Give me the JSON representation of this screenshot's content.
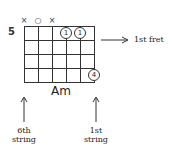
{
  "chord": {
    "name": "Am",
    "start_fret_label": "5",
    "strings": 6,
    "frets": 4,
    "string_markers": [
      {
        "string": 6,
        "symbol": "×",
        "meaning": "muted"
      },
      {
        "string": 5,
        "symbol": "○",
        "meaning": "open"
      },
      {
        "string": 4,
        "symbol": "×",
        "meaning": "muted"
      }
    ],
    "fingers": [
      {
        "string": 3,
        "fret": 1,
        "finger": "1"
      },
      {
        "string": 2,
        "fret": 1,
        "finger": "1"
      },
      {
        "string": 1,
        "fret": 4,
        "finger": "4"
      }
    ]
  },
  "annotations": {
    "first_fret": "1st fret",
    "sixth_string_line1": "6th",
    "sixth_string_line2": "string",
    "first_string_line1": "1st",
    "first_string_line2": "string"
  },
  "colors": {
    "line": "#333333",
    "background": "#ffffff"
  }
}
